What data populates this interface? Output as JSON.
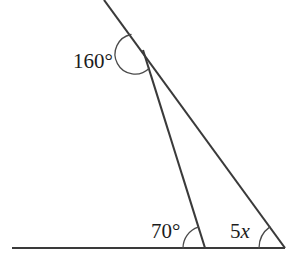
{
  "figure": {
    "type": "geometry-diagram",
    "background_color": "#ffffff",
    "stroke_color": "#3a3a3a",
    "arc_color": "#4a4a4a",
    "label_color": "#1c1c1c"
  },
  "labels": {
    "top_angle": "160°",
    "left_base_angle": "70°",
    "right_base_angle_prefix": "5",
    "right_base_angle_variable": "x"
  },
  "angles": [
    {
      "name": "top-angle",
      "value_text": "160°",
      "degrees": 160,
      "vertex": "apex",
      "vertex_x": 143,
      "vertex_y": 50
    },
    {
      "name": "left-base-angle",
      "value_text": "70°",
      "degrees": 70,
      "vertex": "left-base",
      "vertex_x": 205,
      "vertex_y": 248
    },
    {
      "name": "right-base-angle",
      "value_text": "5x",
      "degrees": null,
      "vertex": "right-base",
      "vertex_x": 285,
      "vertex_y": 248
    }
  ],
  "points": {
    "apex": {
      "x": 143,
      "y": 50
    },
    "ray_top_end": {
      "x": 104,
      "y": 0
    },
    "baseline_left_end": {
      "x": 12,
      "y": 248
    },
    "left_base_vertex": {
      "x": 205,
      "y": 248
    },
    "right_base_vertex": {
      "x": 285,
      "y": 248
    }
  },
  "segments": [
    {
      "name": "upper-ray-through-apex",
      "from": "ray_top_end",
      "to": "right_base_vertex"
    },
    {
      "name": "apex-to-left-base",
      "from": "apex",
      "to": "left_base_vertex"
    },
    {
      "name": "baseline",
      "from": "baseline_left_end",
      "to": "right_base_vertex"
    }
  ]
}
